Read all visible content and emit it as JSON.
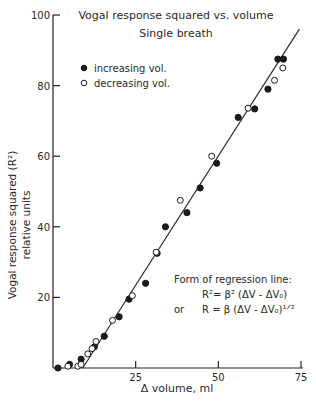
{
  "chart_data": {
    "type": "scatter",
    "title": "Vogal response squared vs. volume",
    "subtitle": "Single breath",
    "xlabel": "Δ volume, ml",
    "ylabel": "Vogal response squared (R²)",
    "ylabel2": "relative units",
    "xlim": [
      0,
      75
    ],
    "ylim": [
      0,
      100
    ],
    "x_ticks": [
      25,
      50,
      75
    ],
    "y_ticks": [
      20,
      40,
      60,
      80,
      100
    ],
    "grid": false,
    "legend_position": "upper-left",
    "legend": [
      {
        "marker": "filled-circle",
        "label": "increasing vol."
      },
      {
        "marker": "open-circle",
        "label": "decreasing vol."
      }
    ],
    "series": [
      {
        "name": "increasing vol.",
        "marker": "filled",
        "points": [
          [
            1.5,
            0
          ],
          [
            5,
            1
          ],
          [
            8.5,
            2.5
          ],
          [
            12.5,
            6
          ],
          [
            15.5,
            9
          ],
          [
            20,
            14.5
          ],
          [
            23,
            19.5
          ],
          [
            28,
            24
          ],
          [
            31.5,
            32.5
          ],
          [
            34,
            40
          ],
          [
            40.5,
            44
          ],
          [
            44.5,
            51
          ],
          [
            49.5,
            58
          ],
          [
            56,
            71
          ],
          [
            61,
            73.4
          ],
          [
            65,
            79
          ],
          [
            68,
            87.5
          ],
          [
            69.7,
            87.5
          ]
        ]
      },
      {
        "name": "decreasing vol.",
        "marker": "open",
        "points": [
          [
            4.5,
            0.5
          ],
          [
            7.5,
            0.5
          ],
          [
            8.5,
            1
          ],
          [
            10.5,
            4
          ],
          [
            11.8,
            5.5
          ],
          [
            13,
            7.5
          ],
          [
            18,
            13.5
          ],
          [
            24,
            20.5
          ],
          [
            31.2,
            32.8
          ],
          [
            38.5,
            47.5
          ],
          [
            48,
            60
          ],
          [
            59,
            73.6
          ],
          [
            67,
            81.5
          ],
          [
            69.5,
            85
          ]
        ]
      }
    ],
    "regression_line": {
      "x0": 9,
      "y0": 0,
      "x1": 74.5,
      "y1": 96
    },
    "annotation": {
      "heading": "Form of regression line:",
      "eq1": "R²= β² (ΔV - ΔV₀)",
      "or": "or",
      "eq2": "R = β  (ΔV - ΔV₀)¹ᐟ²"
    }
  }
}
